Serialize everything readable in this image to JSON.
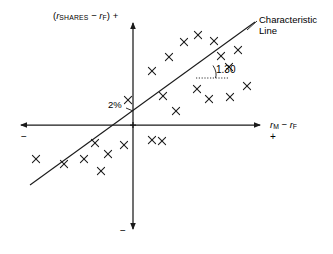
{
  "figure": {
    "background": "#ffffff",
    "ink_color": "#1a1a1a"
  },
  "labels": {
    "y_axis": {
      "prefix": "(",
      "var1": "r",
      "var1_sub": "SHARES",
      "minus": " − ",
      "var2": "r",
      "var2_sub": "F",
      "suffix": ") +"
    },
    "x_axis": {
      "var1": "r",
      "var1_sub": "M",
      "minus": " − ",
      "var2": "r",
      "var2_sub": "F"
    },
    "x_axis_positive": "+",
    "x_axis_negative": "−",
    "y_axis_negative": "−",
    "intercept": "2%",
    "slope": "1.30",
    "line_name_line1": "Characteristic",
    "line_name_line2": "Line"
  },
  "chart_data": {
    "type": "scatter",
    "title": "Characteristic Line",
    "xlabel": "r_M − r_F",
    "ylabel": "(r_SHARES − r_F) +",
    "grid": false,
    "legend": null,
    "axes": {
      "origin_px": [
        133,
        125
      ],
      "x_axis_px": {
        "x1": 18,
        "x2": 263,
        "y": 125
      },
      "y_axis_px": {
        "y1": 20,
        "y2": 232,
        "x": 133
      },
      "x_positive_direction": "right",
      "y_positive_direction": "up",
      "quadrant_signs": {
        "x_left": "−",
        "x_right": "+",
        "y_up": "+",
        "y_down": "−"
      }
    },
    "regression_line": {
      "name": "Characteristic Line",
      "slope": 1.3,
      "intercept_label": "2%",
      "intercept_px": [
        133,
        111
      ],
      "start_px": [
        30,
        185
      ],
      "end_px": [
        255,
        22
      ]
    },
    "slope_annotation": {
      "value": "1.30",
      "arc_center_px": [
        196,
        78
      ],
      "reference_dotted_px": {
        "x1": 196,
        "x2": 228,
        "y": 78
      },
      "label_px": [
        216,
        65
      ]
    },
    "points_px": [
      [
        152,
        71
      ],
      [
        128,
        100
      ],
      [
        163,
        96
      ],
      [
        176,
        111
      ],
      [
        184,
        42
      ],
      [
        169,
        57
      ],
      [
        198,
        35
      ],
      [
        214,
        41
      ],
      [
        197,
        89
      ],
      [
        209,
        99
      ],
      [
        221,
        56
      ],
      [
        229,
        67
      ],
      [
        230,
        97
      ],
      [
        238,
        50
      ],
      [
        152,
        140
      ],
      [
        124,
        145
      ],
      [
        95,
        143
      ],
      [
        108,
        154
      ],
      [
        84,
        159
      ],
      [
        101,
        171
      ],
      [
        64,
        164
      ],
      [
        36,
        159
      ],
      [
        162,
        141
      ],
      [
        247,
        86
      ]
    ],
    "n_points": 24,
    "marker": "x"
  }
}
